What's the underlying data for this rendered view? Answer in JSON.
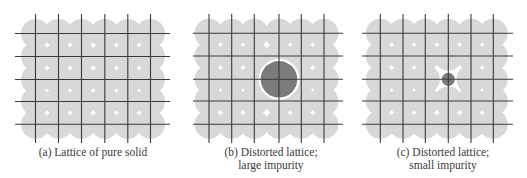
{
  "figure": {
    "colors": {
      "background": "#ffffff",
      "atom": "#d8d8d8",
      "grid_line": "#3a3a3a",
      "impurity": "#7b7b7b",
      "impurity_halo": "#ffffff"
    },
    "atom_radius": 14.5,
    "panels": [
      {
        "id": "a",
        "title": "(a) Lattice of pure solid",
        "caption_lines": [
          "(a) Lattice of pure solid"
        ],
        "caption_center_x": 93,
        "x_lines": [
          35.5,
          58.5,
          81.5,
          104.8,
          127.8,
          150.5
        ],
        "y_lines": [
          33.5,
          56.5,
          79.5,
          101.5,
          124.3
        ],
        "h_line_extent": [
          15,
          170
        ],
        "v_line_extent": [
          14,
          143
        ],
        "impurity": null
      },
      {
        "id": "b",
        "title": "(b) Distorted lattice; large impurity",
        "caption_lines": [
          "(b) Distorted lattice;",
          "large impurity"
        ],
        "caption_center_x": 271,
        "x_lines": [
          209,
          231.7,
          254.3,
          279,
          301.3,
          324
        ],
        "y_lines": [
          33.3,
          56,
          79.3,
          101,
          124.3
        ],
        "h_line_extent": [
          193,
          343
        ],
        "v_line_extent": [
          14,
          143
        ],
        "impurity": {
          "type": "large",
          "col": 3,
          "row": 2,
          "radius": 18.3,
          "halo": 2.2
        }
      },
      {
        "id": "c",
        "title": "(c) Distorted lattice; small impurity",
        "caption_lines": [
          "(c) Distorted lattice;",
          "small impurity"
        ],
        "caption_center_x": 443,
        "x_lines": [
          380.3,
          403,
          425.3,
          448.3,
          471,
          493.3
        ],
        "y_lines": [
          33.3,
          56,
          79.3,
          101,
          124.3
        ],
        "h_line_extent": [
          362,
          513
        ],
        "v_line_extent": [
          14,
          143
        ],
        "impurity": {
          "type": "small",
          "col": 3,
          "row": 2,
          "radius": 6.6,
          "halo": 0
        }
      }
    ]
  }
}
